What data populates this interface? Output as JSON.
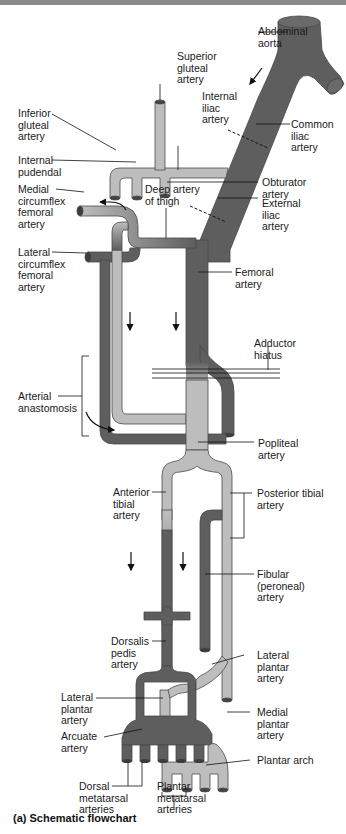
{
  "header": {
    "text": "Lower Limbs"
  },
  "colors": {
    "dark_vessel": "#5e5e5e",
    "light_vessel": "#bdbdbd",
    "outline": "#4a4a4a",
    "label": "#1a1a1a"
  },
  "caption": "(a) Schematic flowchart",
  "labels": {
    "abdominal_aorta": "Abdominal\naorta",
    "superior_gluteal": "Superior\ngluteal\nartery",
    "internal_iliac": "Internal\niliac\nartery",
    "common_iliac": "Common\niliac\nartery",
    "inferior_gluteal": "Inferior\ngluteal\nartery",
    "internal_pudendal": "Internal\npudendal",
    "obturator": "Obturator\nartery",
    "medial_circumflex": "Medial\ncircumflex\nfemoral\nartery",
    "deep_artery_thigh": "Deep artery\nof thigh",
    "external_iliac": "External\niliac\nartery",
    "lateral_circumflex": "Lateral\ncircumflex\nfemoral\nartery",
    "femoral": "Femoral\nartery",
    "adductor_hiatus": "Adductor\nhiatus",
    "arterial_anastomosis": "Arterial\nanastomosis",
    "popliteal": "Popliteal\nartery",
    "anterior_tibial": "Anterior\ntibial\nartery",
    "posterior_tibial": "Posterior tibial\nartery",
    "fibular": "Fibular\n(peroneal)\nartery",
    "dorsalis_pedis": "Dorsalis\npedis\nartery",
    "lateral_plantar_right": "Lateral\nplantar\nartery",
    "lateral_plantar_left": "Lateral\nplantar\nartery",
    "medial_plantar": "Medial\nplantar\nartery",
    "arcuate": "Arcuate\nartery",
    "plantar_arch": "Plantar arch",
    "dorsal_metatarsal": "Dorsal\nmetatarsal\narteries",
    "plantar_metatarsal": "Plantar\nmetatarsal\narteries"
  }
}
